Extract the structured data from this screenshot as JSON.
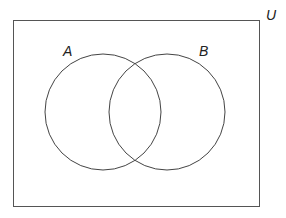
{
  "diagram": {
    "type": "venn",
    "universe": {
      "label": "U",
      "x": 13,
      "y": 20,
      "width": 247,
      "height": 187
    },
    "sets": [
      {
        "label": "A",
        "cx": 103,
        "cy": 112,
        "r": 58,
        "label_x": 63,
        "label_y": 56
      },
      {
        "label": "B",
        "cx": 167,
        "cy": 112,
        "r": 58,
        "label_x": 199,
        "label_y": 56
      }
    ],
    "universe_label_pos": {
      "x": 265,
      "y": 20
    },
    "stroke_color": "#444444",
    "background_color": "#ffffff"
  }
}
